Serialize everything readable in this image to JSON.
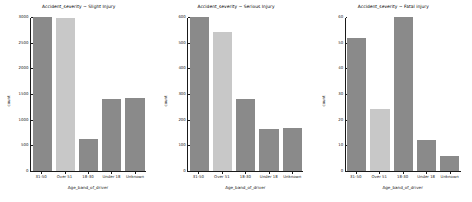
{
  "figure": {
    "background": "#ffffff",
    "width": 472,
    "height": 202,
    "bar_color": "#8a8a8a",
    "highlight_bar_color": "#c8c8c8"
  },
  "chart_data": [
    {
      "type": "bar",
      "title": "Accident_severity ~ Slight Injury",
      "xlabel": "Age_band_of_driver",
      "ylabel": "count",
      "categories": [
        "31-50",
        "Over 51",
        "18-30",
        "Under 18",
        "Unknown"
      ],
      "values": [
        3080,
        2980,
        620,
        1400,
        1430
      ],
      "ylim": [
        0,
        3000
      ],
      "yticks": [
        0,
        500,
        1000,
        1500,
        2000,
        2500,
        3000
      ],
      "ytick_labels": [
        "0",
        "500",
        "1000",
        "1500",
        "2000",
        "2500",
        "3000"
      ],
      "grid": false,
      "legend": "none",
      "bar_colors": [
        "#8a8a8a",
        "#c8c8c8",
        "#8a8a8a",
        "#8a8a8a",
        "#8a8a8a"
      ]
    },
    {
      "type": "bar",
      "title": "Accident_severity ~ Serious Injury",
      "xlabel": "Age_band_of_driver",
      "ylabel": "count",
      "categories": [
        "31-50",
        "Over 51",
        "18-30",
        "Under 18",
        "Unknown"
      ],
      "values": [
        620,
        540,
        280,
        165,
        168
      ],
      "ylim": [
        0,
        600
      ],
      "yticks": [
        0,
        100,
        200,
        300,
        400,
        500,
        600
      ],
      "ytick_labels": [
        "0",
        "100",
        "200",
        "300",
        "400",
        "500",
        "600"
      ],
      "grid": false,
      "legend": "none",
      "bar_colors": [
        "#8a8a8a",
        "#c8c8c8",
        "#8a8a8a",
        "#8a8a8a",
        "#8a8a8a"
      ]
    },
    {
      "type": "bar",
      "title": "Accident_severity ~ Fatal injury",
      "xlabel": "Age_band_of_driver",
      "ylabel": "count",
      "categories": [
        "31-50",
        "Over 51",
        "18-30",
        "Under 18",
        "Unknown"
      ],
      "values": [
        52,
        24,
        62,
        12,
        6
      ],
      "ylim": [
        0,
        60
      ],
      "yticks": [
        0,
        10,
        20,
        30,
        40,
        50,
        60
      ],
      "ytick_labels": [
        "0",
        "10",
        "20",
        "30",
        "40",
        "50",
        "60"
      ],
      "grid": false,
      "legend": "none",
      "bar_colors": [
        "#8a8a8a",
        "#c8c8c8",
        "#8a8a8a",
        "#8a8a8a",
        "#8a8a8a"
      ]
    }
  ]
}
